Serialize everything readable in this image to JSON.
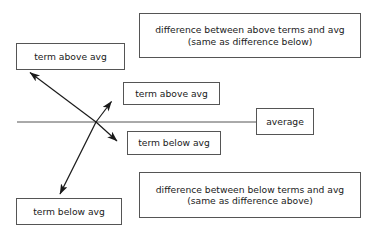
{
  "diagram": {
    "colors": {
      "stroke": "#555555",
      "text": "#1a1a1a",
      "background": "#ffffff"
    },
    "boxes": {
      "diff_above": "difference between above terms and avg\n(same as difference below)",
      "term_above_left": "term above avg",
      "term_above_mid": "term above avg",
      "average": "average",
      "term_below_mid": "term below avg",
      "diff_below": "difference between below terms and avg\n(same as difference above)",
      "term_below_left": "term below avg"
    },
    "lines": {
      "average_line_label": "average baseline",
      "arrow_above_label": "double arrow from term above avg box to below average",
      "arrow_below_label": "double arrow from term below avg box to above average"
    }
  }
}
